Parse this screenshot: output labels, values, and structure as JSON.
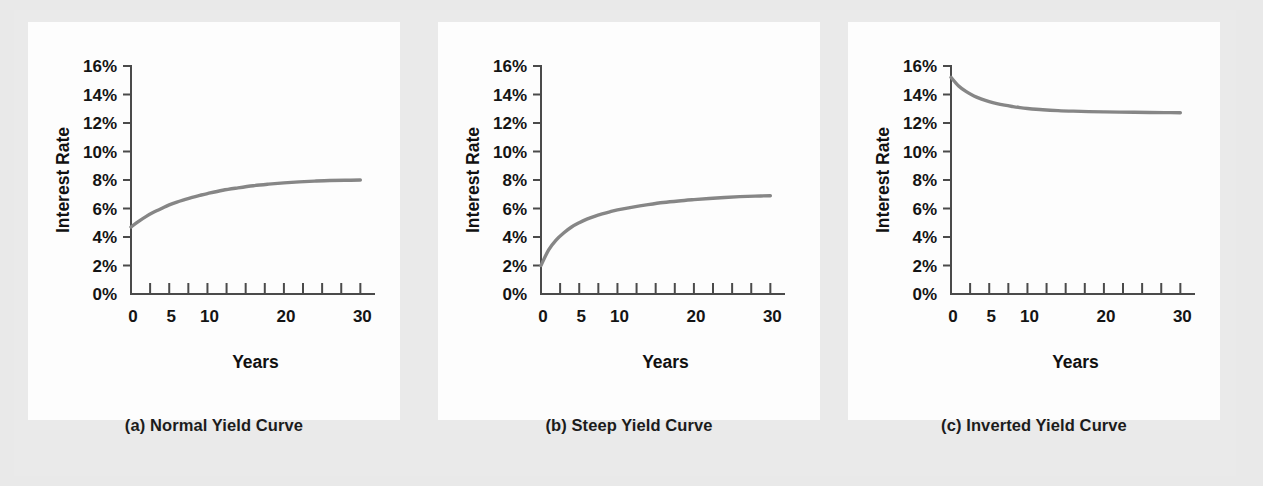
{
  "figure": {
    "background_color": "#e9e9e9",
    "panel_background_color": "#fdfdfd",
    "curve_color": "#868686",
    "axis_color": "#4a4a4a",
    "text_color": "#141414"
  },
  "panels": [
    {
      "key": "a",
      "caption": "(a) Normal Yield Curve",
      "chart_data": {
        "type": "line",
        "title": "(a) Normal Yield Curve",
        "xlabel": "Years",
        "ylabel": "Interest Rate",
        "xlim": [
          0,
          31
        ],
        "ylim": [
          0,
          16
        ],
        "grid": false,
        "legend": "none",
        "x_tick_labels": [
          "0",
          "5",
          "10",
          "20",
          "30"
        ],
        "x_tick_values": [
          0,
          5,
          10,
          20,
          30
        ],
        "x_minor_tick_values": [
          0,
          2.5,
          5,
          7.5,
          10,
          12.5,
          15,
          17.5,
          20,
          22.5,
          25,
          27.5,
          30
        ],
        "y_tick_labels": [
          "0%",
          "2%",
          "4%",
          "6%",
          "8%",
          "10%",
          "12%",
          "14%",
          "16%"
        ],
        "y_tick_values": [
          0,
          2,
          4,
          6,
          8,
          10,
          12,
          14,
          16
        ],
        "series": [
          {
            "name": "Normal yield curve",
            "color": "#868686",
            "x": [
              0,
              1,
              2,
              3,
              4,
              5,
              6,
              7,
              8,
              9,
              10,
              12,
              14,
              16,
              18,
              20,
              22,
              24,
              26,
              28,
              30
            ],
            "values": [
              4.7,
              5.1,
              5.45,
              5.75,
              6.0,
              6.25,
              6.45,
              6.62,
              6.78,
              6.92,
              7.05,
              7.28,
              7.45,
              7.6,
              7.71,
              7.8,
              7.87,
              7.92,
              7.96,
              7.98,
              8.0
            ]
          }
        ]
      }
    },
    {
      "key": "b",
      "caption": "(b) Steep Yield Curve",
      "chart_data": {
        "type": "line",
        "title": "(b) Steep Yield Curve",
        "xlabel": "Years",
        "ylabel": "Interest Rate",
        "xlim": [
          0,
          31
        ],
        "ylim": [
          0,
          16
        ],
        "grid": false,
        "legend": "none",
        "x_tick_labels": [
          "0",
          "5",
          "10",
          "20",
          "30"
        ],
        "x_tick_values": [
          0,
          5,
          10,
          20,
          30
        ],
        "x_minor_tick_values": [
          0,
          2.5,
          5,
          7.5,
          10,
          12.5,
          15,
          17.5,
          20,
          22.5,
          25,
          27.5,
          30
        ],
        "y_tick_labels": [
          "0%",
          "2%",
          "4%",
          "6%",
          "8%",
          "10%",
          "12%",
          "14%",
          "16%"
        ],
        "y_tick_values": [
          0,
          2,
          4,
          6,
          8,
          10,
          12,
          14,
          16
        ],
        "series": [
          {
            "name": "Steep yield curve",
            "color": "#868686",
            "x": [
              0,
              1,
              2,
              3,
              4,
              5,
              6,
              7,
              8,
              9,
              10,
              12,
              14,
              16,
              18,
              20,
              22,
              24,
              26,
              28,
              30
            ],
            "values": [
              2.0,
              3.1,
              3.8,
              4.3,
              4.7,
              5.0,
              5.25,
              5.45,
              5.62,
              5.77,
              5.9,
              6.1,
              6.27,
              6.42,
              6.53,
              6.62,
              6.7,
              6.77,
              6.83,
              6.87,
              6.9
            ]
          }
        ]
      }
    },
    {
      "key": "c",
      "caption": "(c) Inverted Yield Curve",
      "chart_data": {
        "type": "line",
        "title": "(c) Inverted Yield Curve",
        "xlabel": "Years",
        "ylabel": "Interest Rate",
        "xlim": [
          0,
          31
        ],
        "ylim": [
          0,
          16
        ],
        "grid": false,
        "legend": "none",
        "x_tick_labels": [
          "0",
          "5",
          "10",
          "20",
          "30"
        ],
        "x_tick_values": [
          0,
          5,
          10,
          20,
          30
        ],
        "x_minor_tick_values": [
          0,
          2.5,
          5,
          7.5,
          10,
          12.5,
          15,
          17.5,
          20,
          22.5,
          25,
          27.5,
          30
        ],
        "y_tick_labels": [
          "0%",
          "2%",
          "4%",
          "6%",
          "8%",
          "10%",
          "12%",
          "14%",
          "16%"
        ],
        "y_tick_values": [
          0,
          2,
          4,
          6,
          8,
          10,
          12,
          14,
          16
        ],
        "series": [
          {
            "name": "Inverted yield curve",
            "color": "#868686",
            "x": [
              0,
              1,
              2,
              3,
              4,
              5,
              6,
              7,
              8,
              9,
              10,
              12,
              14,
              16,
              18,
              20,
              22,
              24,
              26,
              28,
              30
            ],
            "values": [
              15.2,
              14.6,
              14.2,
              13.9,
              13.68,
              13.5,
              13.36,
              13.25,
              13.16,
              13.08,
              13.02,
              12.93,
              12.87,
              12.83,
              12.8,
              12.78,
              12.76,
              12.75,
              12.74,
              12.73,
              12.72
            ]
          }
        ]
      }
    }
  ]
}
